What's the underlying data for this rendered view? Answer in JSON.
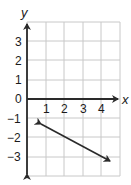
{
  "graph": {
    "x_axis_label": "x",
    "y_axis_label": "y",
    "x_ticks": [
      {
        "label": "1",
        "value": 1
      },
      {
        "label": "2",
        "value": 2
      },
      {
        "label": "3",
        "value": 3
      },
      {
        "label": "4",
        "value": 4
      }
    ],
    "y_ticks": [
      {
        "label": "3",
        "value": 3
      },
      {
        "label": "2",
        "value": 2
      },
      {
        "label": "1",
        "value": 1
      },
      {
        "label": "0",
        "value": 0
      },
      {
        "label": "−1",
        "value": -1
      },
      {
        "label": "−2",
        "value": -2
      },
      {
        "label": "−3",
        "value": -3
      }
    ],
    "grid": {
      "x_min": 0,
      "x_max": 5,
      "y_min": -4,
      "y_max": 4
    },
    "line": {
      "start": [
        0.75,
        -1.3
      ],
      "end": [
        4.45,
        -3.2
      ],
      "arrows": "both"
    },
    "colors": {
      "grid": "#c8c8c8",
      "axis": "#2a2a2a",
      "line": "#2a2a2a",
      "text": "#1a1a1a"
    }
  }
}
